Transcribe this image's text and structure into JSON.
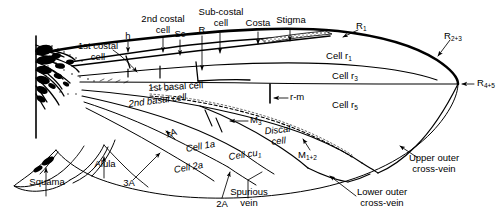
{
  "figure": {
    "ink_color": "#000000",
    "background_color": "#ffffff"
  },
  "labels": {
    "first_costal_cell": "1st costal\ncell",
    "second_costal_cell": "2nd costal\ncell",
    "sub_costal_cell": "Sub-costal\ncell",
    "costa": "Costa",
    "stigma": "Stigma",
    "h": "h",
    "sc": "Sc",
    "r": "R",
    "r1": "R",
    "r1_sub": "1",
    "r23": "R",
    "r23_sub": "2+3",
    "r45": "R",
    "r45_sub": "4+5",
    "cell_r1": "Cell r",
    "cell_r1_sub": "1",
    "cell_r3": "Cell r",
    "cell_r3_sub": "3",
    "cell_r5": "Cell r",
    "cell_r5_sub": "5",
    "first_basal_cell": "1st basal cell",
    "second_basal_cell": "2nd basal cell",
    "r_m": "r-m",
    "m3": "M",
    "m3_sub": "3",
    "m12": "M",
    "m12_sub": "1+2",
    "discal_cell": "Discal\ncell",
    "cell_cu1": "Cell cu",
    "cell_cu1_sub": "1",
    "cell_1a": "Cell 1a",
    "cell_2a": "Cell 2a",
    "vein_1a": "1A",
    "vein_2a": "2A",
    "vein_3a": "3A",
    "alula": "Alula",
    "squama": "Squama",
    "spurious_vein": "Spurious\nvein",
    "upper_outer_cross_vein": "Upper outer\ncross-vein",
    "lower_outer_cross_vein": "Lower outer\ncross-vein"
  },
  "label_lines": {
    "first_costal_cell": [
      "1st costal",
      "cell"
    ],
    "second_costal_cell": [
      "2nd costal",
      "cell"
    ],
    "sub_costal_cell": [
      "Sub-costal",
      "cell"
    ],
    "discal_cell": [
      "Discal",
      "cell"
    ],
    "spurious_vein": [
      "Spurious",
      "vein"
    ],
    "upper_outer_cross_vein": [
      "Upper outer",
      "cross-vein"
    ],
    "lower_outer_cross_vein": [
      "Lower outer",
      "cross-vein"
    ]
  }
}
